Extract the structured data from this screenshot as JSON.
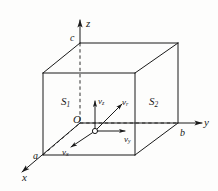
{
  "figure": {
    "type": "3d-coordinate-box-diagram",
    "background_color": "#fdfdfc",
    "line_color": "#1a1a1a",
    "axes": [
      {
        "name": "z-axis",
        "label": "z",
        "direction": "up"
      },
      {
        "name": "y-axis",
        "label": "y",
        "direction": "right"
      },
      {
        "name": "x-axis",
        "label": "x",
        "direction": "lower-left"
      }
    ],
    "corner_labels": [
      {
        "name": "c",
        "label": "c",
        "axis": "z"
      },
      {
        "name": "b",
        "label": "b",
        "axis": "y"
      },
      {
        "name": "a",
        "label": "a",
        "axis": "x"
      }
    ],
    "surfaces": [
      {
        "name": "S1",
        "base": "S",
        "subscript": "1"
      },
      {
        "name": "S2",
        "base": "S",
        "subscript": "2"
      }
    ],
    "origin": {
      "label": "O"
    },
    "vectors": [
      {
        "name": "v-z",
        "base": "v",
        "subscript": "z",
        "direction": "up"
      },
      {
        "name": "v-resultant",
        "base": "v",
        "subscript": "r",
        "direction": "upper-right"
      },
      {
        "name": "v-y",
        "base": "v",
        "subscript": "y",
        "direction": "right"
      },
      {
        "name": "v-x",
        "base": "v",
        "subscript": "x",
        "direction": "lower-left"
      }
    ]
  }
}
